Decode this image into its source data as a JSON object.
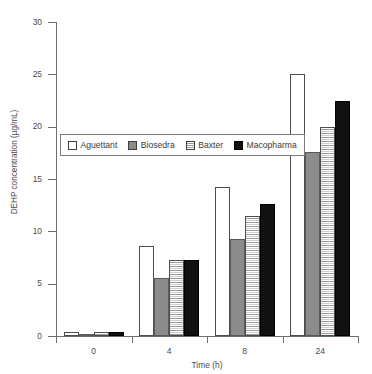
{
  "chart_data": {
    "type": "bar",
    "title": "",
    "xlabel": "Time (h)",
    "ylabel": "DEHP concentration (µg/mL)",
    "categories": [
      "0",
      "4",
      "8",
      "24"
    ],
    "ylim": [
      0,
      30
    ],
    "yticks": [
      0,
      5,
      10,
      15,
      20,
      25,
      30
    ],
    "ytick_labels": [
      "0",
      "5",
      "10",
      "15",
      "20",
      "25",
      "30"
    ],
    "grid": false,
    "legend_position": "upper left inside",
    "series": [
      {
        "name": "Aguettant",
        "values": [
          0.4,
          8.6,
          14.2,
          25.0
        ],
        "fill": "white",
        "color": "#ffffff"
      },
      {
        "name": "Biosedra",
        "values": [
          0.2,
          5.5,
          9.3,
          17.6
        ],
        "fill": "gray",
        "color": "#8c8c8c"
      },
      {
        "name": "Baxter",
        "values": [
          0.35,
          7.3,
          11.5,
          20.0
        ],
        "fill": "hatch",
        "color": "#f2f2f2"
      },
      {
        "name": "Macopharma",
        "values": [
          0.35,
          7.3,
          12.6,
          22.5
        ],
        "fill": "black",
        "color": "#111111"
      }
    ]
  },
  "axes": {
    "x_title": "Time (h)",
    "y_title": "DEHP concentration (µg/mL)"
  },
  "legend": {
    "items": [
      {
        "label": "Aguettant"
      },
      {
        "label": "Biosedra"
      },
      {
        "label": "Baxter"
      },
      {
        "label": "Macopharma"
      }
    ]
  }
}
